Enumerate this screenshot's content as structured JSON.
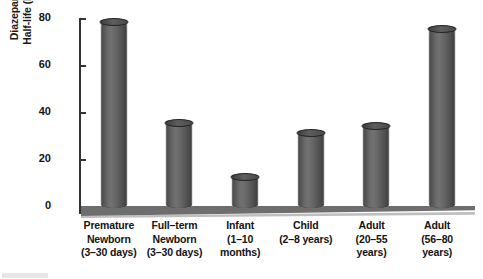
{
  "chart_data": {
    "type": "bar",
    "title": "",
    "subtitle": "",
    "xlabel": "",
    "ylabel": "Diazepam Half-life (hr)",
    "ylabel_lines": [
      "Diazepam",
      "Half-life (hr)"
    ],
    "categories": [
      "Premature Newborn (3–30 days)",
      "Full–term Newborn (3–30 days)",
      "Infant (1–10 months)",
      "Child (2–8 years)",
      "Adult (20–55 years)",
      "Adult (56–80 years)"
    ],
    "category_lines": [
      [
        "Premature",
        "Newborn",
        "(3–30 days)"
      ],
      [
        "Full–term",
        "Newborn",
        "(3–30 days)"
      ],
      [
        "Infant",
        "(1–10",
        "months)"
      ],
      [
        "Child",
        "(2–8 years)"
      ],
      [
        "Adult",
        "(20–55",
        "years)"
      ],
      [
        "Adult",
        "(56–80",
        "years)"
      ]
    ],
    "values": [
      79,
      36,
      13,
      32,
      35,
      76
    ],
    "ylim": [
      0,
      80
    ],
    "yticks": [
      0,
      20,
      40,
      60,
      80
    ],
    "ytick_labels": [
      "0",
      "20",
      "40",
      "60",
      "80"
    ],
    "grid": false,
    "legend": false,
    "legend_position": "none",
    "style": "3d-cylinder",
    "colors": {
      "bar": "#5c5c5c",
      "bar_highlight": "#717171",
      "bar_shadow": "#3f3f3f",
      "bar_top": "#4a4a4a",
      "axis": "#333333",
      "text": "#141414",
      "floor": "#6e6e6e",
      "background": "#ffffff"
    }
  }
}
